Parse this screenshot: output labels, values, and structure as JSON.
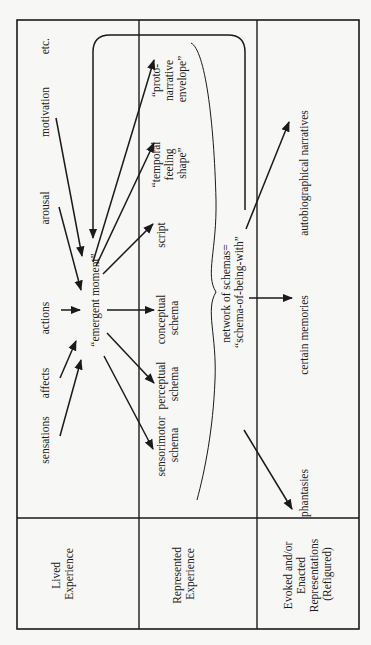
{
  "frame": {
    "x": 17,
    "y": 20,
    "w": 342,
    "h": 609,
    "col_dividers": [
      139,
      257
    ],
    "row_divider": 518
  },
  "row_headers": [
    {
      "id": "lived",
      "lines": [
        "Lived",
        "Experience"
      ],
      "x": 78,
      "y": 574
    },
    {
      "id": "represented",
      "lines": [
        "Represented",
        "Experience"
      ],
      "x": 198,
      "y": 574
    },
    {
      "id": "evoked",
      "lines": [
        "Evoked and/or",
        "Enacted",
        "Representations",
        "(Refigured)"
      ],
      "x": 308,
      "y": 574
    }
  ],
  "lived_inputs": [
    {
      "id": "sensations",
      "label": "sensations",
      "x": 33,
      "y": 440
    },
    {
      "id": "affects",
      "label": "affects",
      "x": 33,
      "y": 383
    },
    {
      "id": "actions",
      "label": "actions",
      "x": 33,
      "y": 318
    },
    {
      "id": "arousal",
      "label": "arousal",
      "x": 33,
      "y": 208
    },
    {
      "id": "motivation",
      "label": "motivation",
      "x": 33,
      "y": 112
    },
    {
      "id": "etc",
      "label": "etc.",
      "x": 33,
      "y": 38
    }
  ],
  "center": {
    "label": "“emergent moment”",
    "x": 95,
    "y": 308
  },
  "represented_outputs": [
    {
      "id": "sensorimotor",
      "lines": [
        "sensorimotor",
        "schema"
      ],
      "x": 165,
      "y": 445
    },
    {
      "id": "perceptual",
      "lines": [
        "perceptual",
        "schema"
      ],
      "x": 165,
      "y": 384
    },
    {
      "id": "conceptual",
      "lines": [
        "conceptual",
        "schema"
      ],
      "x": 165,
      "y": 318
    },
    {
      "id": "script",
      "lines": [
        "script"
      ],
      "x": 165,
      "y": 235
    },
    {
      "id": "temporal",
      "lines": [
        "“temporal",
        "feeling",
        "shape”"
      ],
      "x": 160,
      "y": 163
    },
    {
      "id": "proto",
      "lines": [
        "“proto-",
        "narrative",
        "envelope”"
      ],
      "x": 160,
      "y": 79
    }
  ],
  "network": {
    "lines": [
      "network of schemas=",
      "“schema-of-being-with”"
    ],
    "x": 230,
    "y": 290
  },
  "evoked_outputs": [
    {
      "id": "phantasies",
      "label": "phantasies",
      "x": 305,
      "y": 493
    },
    {
      "id": "memories",
      "label": "certain memories",
      "x": 305,
      "y": 335
    },
    {
      "id": "autobiographical",
      "label": "autobiographical narratives",
      "x": 305,
      "y": 173
    }
  ],
  "colors": {
    "ink": "#1a1a1a",
    "paper": "#f7f7f5"
  }
}
